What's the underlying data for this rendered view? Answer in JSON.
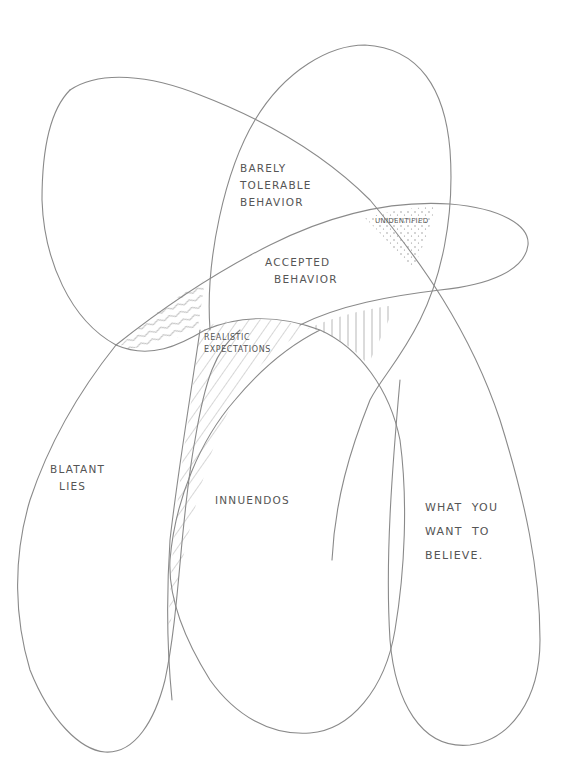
{
  "diagram": {
    "type": "hand-drawn overlapping venn diagram",
    "stroke_color": "#8a8a8a",
    "text_color": "#555555",
    "background": "#ffffff",
    "regions": [
      {
        "id": "barely-tolerable",
        "label": "BARELY\nTOLERABLE\nBEHAVIOR",
        "pattern": "none"
      },
      {
        "id": "unidentified",
        "label": "UNIDENTIFIED",
        "pattern": "dots"
      },
      {
        "id": "accepted",
        "label": "ACCEPTED\n  BEHAVIOR",
        "pattern": "none"
      },
      {
        "id": "realistic",
        "label": "REALISTIC\nEXPECTATIONS",
        "pattern": "diagonal-lines"
      },
      {
        "id": "blatant-lies",
        "label": "BLATANT\n  LIES",
        "pattern": "none"
      },
      {
        "id": "innuendos",
        "label": "INNUENDOS",
        "pattern": "none"
      },
      {
        "id": "what-you-want",
        "label": "WHAT  YOU\nWANT  TO\nBELIEVE.",
        "pattern": "none"
      },
      {
        "id": "wavy-overlap",
        "label": "",
        "pattern": "wavy-lines"
      },
      {
        "id": "vertical-overlap",
        "label": "",
        "pattern": "vertical-lines"
      }
    ]
  }
}
